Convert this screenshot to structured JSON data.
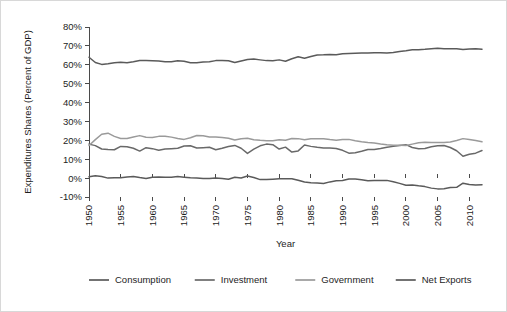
{
  "chart_data": {
    "type": "line",
    "title": "",
    "xlabel": "Year",
    "ylabel": "Expenditures Shares (Percent of GDP)",
    "xlim": [
      1950,
      2012
    ],
    "ylim": [
      -10,
      80
    ],
    "grid": false,
    "legend_position": "bottom",
    "ytick_labels": [
      "80%",
      "70%",
      "60%",
      "50%",
      "40%",
      "30%",
      "20%",
      "10%",
      "0%",
      "-10%"
    ],
    "ytick_values": [
      80,
      70,
      60,
      50,
      40,
      30,
      20,
      10,
      0,
      -10
    ],
    "xtick_labels": [
      "1950",
      "1955",
      "1960",
      "1965",
      "1970",
      "1975",
      "1980",
      "1985",
      "1990",
      "1995",
      "2000",
      "2005",
      "2010"
    ],
    "xtick_values": [
      1950,
      1955,
      1960,
      1965,
      1970,
      1975,
      1980,
      1985,
      1990,
      1995,
      2000,
      2005,
      2010
    ],
    "x": [
      1950,
      1951,
      1952,
      1953,
      1954,
      1955,
      1956,
      1957,
      1958,
      1959,
      1960,
      1961,
      1962,
      1963,
      1964,
      1965,
      1966,
      1967,
      1968,
      1969,
      1970,
      1971,
      1972,
      1973,
      1974,
      1975,
      1976,
      1977,
      1978,
      1979,
      1980,
      1981,
      1982,
      1983,
      1984,
      1985,
      1986,
      1987,
      1988,
      1989,
      1990,
      1991,
      1992,
      1993,
      1994,
      1995,
      1996,
      1997,
      1998,
      1999,
      2000,
      2001,
      2002,
      2003,
      2004,
      2005,
      2006,
      2007,
      2008,
      2009,
      2010,
      2011,
      2012
    ],
    "series": [
      {
        "name": "Consumption",
        "color": "#5a5a5a",
        "values": [
          64.0,
          61.2,
          60.2,
          60.6,
          61.1,
          61.3,
          61.1,
          61.6,
          62.3,
          62.2,
          62.1,
          62.0,
          61.6,
          61.6,
          62.1,
          61.9,
          61.1,
          61.1,
          61.5,
          61.6,
          62.2,
          62.2,
          62.1,
          61.2,
          62.0,
          62.8,
          63.0,
          62.6,
          62.2,
          62.1,
          62.6,
          61.9,
          63.2,
          64.2,
          63.5,
          64.4,
          65.2,
          65.3,
          65.5,
          65.3,
          65.8,
          66.0,
          66.1,
          66.2,
          66.2,
          66.4,
          66.4,
          66.3,
          66.5,
          67.0,
          67.4,
          67.9,
          68.0,
          68.2,
          68.5,
          68.8,
          68.5,
          68.5,
          68.5,
          68.1,
          68.3,
          68.5,
          68.2
        ]
      },
      {
        "name": "Investment",
        "color": "#696969",
        "values": [
          18.0,
          17.2,
          15.4,
          15.1,
          15.0,
          16.8,
          16.6,
          15.8,
          14.3,
          16.1,
          15.6,
          14.8,
          15.4,
          15.6,
          15.8,
          17.0,
          17.1,
          15.9,
          16.1,
          16.3,
          15.0,
          15.8,
          16.7,
          17.3,
          15.8,
          13.1,
          15.3,
          17.1,
          18.0,
          17.7,
          15.4,
          16.4,
          13.8,
          14.4,
          17.5,
          16.8,
          16.3,
          16.0,
          15.9,
          15.7,
          14.7,
          13.2,
          13.4,
          14.2,
          15.1,
          15.2,
          15.7,
          16.3,
          16.8,
          17.3,
          17.7,
          16.2,
          15.6,
          15.7,
          16.6,
          17.1,
          17.3,
          16.2,
          14.5,
          11.6,
          12.6,
          13.2,
          14.6
        ]
      },
      {
        "name": "Government",
        "color": "#9a9a9a",
        "values": [
          17.3,
          20.4,
          23.2,
          23.8,
          22.1,
          21.0,
          21.0,
          21.8,
          22.5,
          21.6,
          21.5,
          22.1,
          22.2,
          21.7,
          21.0,
          20.5,
          21.4,
          22.6,
          22.4,
          21.8,
          21.8,
          21.5,
          21.1,
          20.2,
          20.8,
          21.1,
          20.3,
          20.0,
          19.8,
          19.8,
          20.3,
          20.0,
          21.0,
          20.9,
          20.3,
          20.8,
          20.9,
          20.8,
          20.4,
          20.1,
          20.4,
          20.5,
          19.8,
          19.3,
          18.9,
          18.6,
          18.1,
          17.7,
          17.4,
          17.4,
          17.3,
          18.0,
          18.7,
          19.0,
          18.9,
          18.9,
          18.9,
          19.1,
          19.9,
          20.9,
          20.5,
          19.9,
          19.2
        ]
      },
      {
        "name": "Net Exports",
        "color": "#5a5a5a",
        "values": [
          0.7,
          1.2,
          0.9,
          0.0,
          0.2,
          0.2,
          0.6,
          0.9,
          0.3,
          -0.2,
          0.5,
          0.6,
          0.4,
          0.5,
          0.8,
          0.5,
          0.2,
          0.1,
          -0.2,
          -0.2,
          0.1,
          -0.2,
          -0.6,
          0.5,
          0.1,
          1.1,
          0.3,
          -0.8,
          -0.8,
          -0.6,
          -0.4,
          -0.3,
          -0.3,
          -1.1,
          -2.1,
          -2.4,
          -2.6,
          -2.8,
          -2.0,
          -1.4,
          -1.3,
          -0.5,
          -0.5,
          -0.9,
          -1.4,
          -1.2,
          -1.2,
          -1.2,
          -1.9,
          -2.8,
          -3.8,
          -3.6,
          -4.1,
          -4.5,
          -5.3,
          -5.7,
          -5.6,
          -5.0,
          -4.9,
          -2.7,
          -3.4,
          -3.7,
          -3.5
        ]
      }
    ]
  },
  "legend": [
    {
      "label": "Consumption",
      "color": "#5a5a5a"
    },
    {
      "label": "Investment",
      "color": "#696969"
    },
    {
      "label": "Government",
      "color": "#9a9a9a"
    },
    {
      "label": "Net Exports",
      "color": "#5a5a5a"
    }
  ]
}
